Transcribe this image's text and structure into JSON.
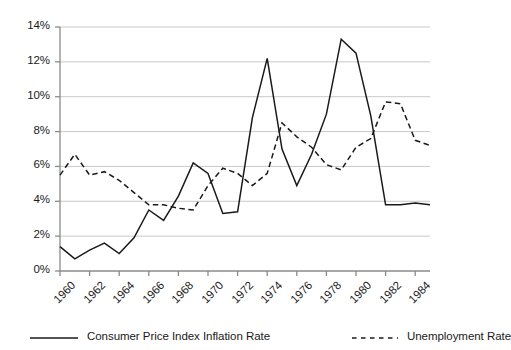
{
  "chart_data": {
    "type": "line",
    "title": "",
    "subtitle": "",
    "xlabel": "",
    "ylabel": "",
    "xlim": [
      1960,
      1985
    ],
    "ylim": [
      0,
      14
    ],
    "grid": true,
    "grid_axis": "y",
    "legend_position": "bottom",
    "y_tick_labels": [
      "0%",
      "2%",
      "4%",
      "6%",
      "8%",
      "10%",
      "12%",
      "14%"
    ],
    "y_tick_values": [
      0,
      2,
      4,
      6,
      8,
      10,
      12,
      14
    ],
    "x_tick_labels": [
      "1960",
      "1962",
      "1964",
      "1966",
      "1968",
      "1970",
      "1972",
      "1974",
      "1976",
      "1978",
      "1980",
      "1982",
      "1984"
    ],
    "x_tick_values": [
      1960,
      1962,
      1964,
      1966,
      1968,
      1970,
      1972,
      1974,
      1976,
      1978,
      1980,
      1982,
      1984
    ],
    "x": [
      1960,
      1961,
      1962,
      1963,
      1964,
      1965,
      1966,
      1967,
      1968,
      1969,
      1970,
      1971,
      1972,
      1973,
      1974,
      1975,
      1976,
      1977,
      1978,
      1979,
      1980,
      1981,
      1982,
      1983,
      1984,
      1985
    ],
    "series": [
      {
        "name": "Consumer Price Index Inflation Rate",
        "style": "solid",
        "color": "#1a1a1a",
        "values": [
          1.4,
          0.7,
          1.2,
          1.6,
          1.0,
          1.9,
          3.5,
          2.9,
          4.3,
          6.2,
          5.6,
          3.3,
          3.4,
          8.8,
          12.2,
          7.0,
          4.9,
          6.7,
          9.0,
          13.3,
          12.5,
          8.9,
          3.8,
          3.8,
          3.9,
          3.8
        ]
      },
      {
        "name": "Unemployment Rate",
        "style": "dashed",
        "color": "#1a1a1a",
        "values": [
          5.5,
          6.7,
          5.5,
          5.7,
          5.2,
          4.5,
          3.8,
          3.8,
          3.6,
          3.5,
          4.9,
          5.9,
          5.6,
          4.9,
          5.6,
          8.5,
          7.7,
          7.1,
          6.1,
          5.8,
          7.1,
          7.6,
          9.7,
          9.6,
          7.5,
          7.2
        ]
      }
    ]
  },
  "legend": {
    "items": [
      {
        "label": "Consumer Price Index Inflation Rate",
        "style": "solid"
      },
      {
        "label": "Unemployment Rate",
        "style": "dashed"
      }
    ]
  }
}
